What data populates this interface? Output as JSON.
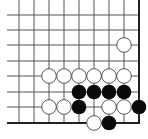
{
  "board": {
    "description": "Go board fragment, lower-right corner",
    "colors": {
      "background": "#ffffff",
      "grid_line": "#555555",
      "edge_line": "#222222",
      "black_stone": "#0a0a0a",
      "white_stone_fill": "#ffffff",
      "white_stone_stroke": "#555555"
    },
    "grid": {
      "columns_x": [
        19,
        34,
        49,
        64,
        79,
        94,
        109,
        124,
        139
      ],
      "rows_y": [
        15,
        30,
        45,
        61,
        76,
        92,
        107,
        123
      ],
      "line_left_x": 7,
      "top_y": 0,
      "right_edge_x": 139,
      "bottom_edge_y": 123
    },
    "stone_radius": 7.3,
    "stones": [
      {
        "color": "white",
        "col": 7,
        "row": 2
      },
      {
        "color": "white",
        "col": 2,
        "row": 4
      },
      {
        "color": "white",
        "col": 3,
        "row": 4
      },
      {
        "color": "white",
        "col": 4,
        "row": 4
      },
      {
        "color": "white",
        "col": 5,
        "row": 4
      },
      {
        "color": "white",
        "col": 6,
        "row": 4
      },
      {
        "color": "white",
        "col": 7,
        "row": 4
      },
      {
        "color": "black",
        "col": 4,
        "row": 5
      },
      {
        "color": "black",
        "col": 5,
        "row": 5
      },
      {
        "color": "black",
        "col": 6,
        "row": 5
      },
      {
        "color": "black",
        "col": 7,
        "row": 5
      },
      {
        "color": "white",
        "col": 2,
        "row": 6
      },
      {
        "color": "white",
        "col": 3,
        "row": 6
      },
      {
        "color": "black",
        "col": 4,
        "row": 6
      },
      {
        "color": "white",
        "col": 6,
        "row": 6
      },
      {
        "color": "white",
        "col": 7,
        "row": 6
      },
      {
        "color": "black",
        "col": 8,
        "row": 6
      },
      {
        "color": "white",
        "col": 5,
        "row": 7
      },
      {
        "color": "black",
        "col": 6,
        "row": 7
      }
    ]
  }
}
